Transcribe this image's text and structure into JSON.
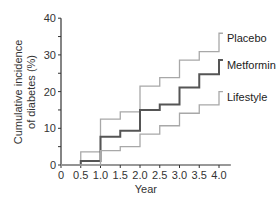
{
  "chart_data": {
    "type": "line",
    "step": true,
    "title": "",
    "xlabel": "Year",
    "ylabel": "Cumulative incidence of diabetes (%)",
    "ylabel_lines": [
      "Cumulative incidence",
      "of diabetes (%)"
    ],
    "xlim": [
      0,
      4.3
    ],
    "ylim": [
      0,
      40
    ],
    "x_ticks": [
      "0",
      "0.5",
      "1.0",
      "1.5",
      "2.0",
      "2.5",
      "3.0",
      "3.5",
      "4.0"
    ],
    "y_ticks": [
      "0",
      "10",
      "20",
      "30",
      "40"
    ],
    "grid": false,
    "legend_position": "inline-right",
    "x": [
      0,
      0.5,
      1.0,
      1.5,
      2.0,
      2.5,
      3.0,
      3.5,
      4.0
    ],
    "series": [
      {
        "name": "Placebo",
        "color": "#a8a8a8",
        "values": [
          0,
          3.6,
          12.5,
          14.5,
          21.5,
          23.8,
          28.6,
          30.9,
          35.9
        ]
      },
      {
        "name": "Metformin",
        "color": "#555555",
        "values": [
          0,
          1.1,
          7.7,
          9.3,
          15.0,
          16.5,
          21.1,
          24.7,
          28.6
        ]
      },
      {
        "name": "Lifestyle",
        "color": "#a8a8a8",
        "values": [
          0,
          0,
          3.9,
          5.0,
          8.4,
          10.7,
          14.1,
          16.4,
          20.0
        ]
      }
    ],
    "x_end": 4.1
  }
}
